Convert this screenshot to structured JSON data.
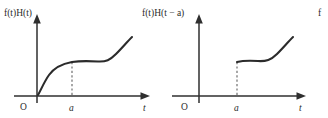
{
  "figure": {
    "title_cut_right": "f",
    "panels": [
      {
        "id": "panel-1",
        "expression": "f(t)H(t)",
        "expression_parts": [
          "f",
          "(",
          "t",
          ")",
          "H",
          "(",
          "t",
          ")"
        ],
        "origin_label": "O",
        "x_tick_label": "a",
        "x_axis_label": "t",
        "description": "smooth curve rising from the origin, flattening near t = a, then rising again",
        "continuous_at_a": true
      },
      {
        "id": "panel-2",
        "expression": "f(t)H(t − a)",
        "expression_parts": [
          "f",
          "(",
          "t",
          ")",
          "H",
          "(",
          "t",
          " − ",
          "a",
          ")"
        ],
        "origin_label": "O",
        "x_tick_label": "a",
        "x_axis_label": "t",
        "description": "curve is zero for t < a then jumps up at t = a, flattens, then rises again",
        "continuous_at_a": false
      },
      {
        "id": "panel-3-cut",
        "expression": "f",
        "description": "third panel cropped at the right edge of the image, only the leading italic f of its label is visible"
      }
    ],
    "colors": {
      "curve": "#2b2b2b",
      "axis": "#2f2f2f",
      "dashed_guide": "#6e6e6e",
      "background": "#ffffff",
      "text": "#2b2b2b"
    }
  }
}
